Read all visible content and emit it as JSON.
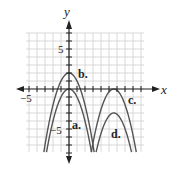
{
  "chart_data": {
    "type": "line",
    "title": "",
    "xlabel": "x",
    "ylabel": "y",
    "xlim": [
      -5.4,
      9.4
    ],
    "ylim": [
      -7.9,
      7.0
    ],
    "grid": true,
    "tick_labels": {
      "x": [
        "-5"
      ],
      "y": [
        "5",
        "-5"
      ]
    },
    "series": [
      {
        "name": "a.",
        "equation": "y = -x^2",
        "vertex": [
          0,
          0
        ]
      },
      {
        "name": "b.",
        "equation": "y = -x^2 + 2",
        "vertex": [
          0,
          2
        ]
      },
      {
        "name": "c.",
        "equation": "y = -(x - 6)^2",
        "vertex": [
          6,
          0
        ]
      },
      {
        "name": "d.",
        "equation": "y = -(x - 6)^2 - 3",
        "vertex": [
          6,
          -3
        ]
      }
    ]
  },
  "labels": {
    "x_axis": "x",
    "y_axis": "y",
    "x_tick_neg5": "−5",
    "y_tick_5": "5",
    "y_tick_neg5": "−5",
    "curve_a": "a.",
    "curve_b": "b.",
    "curve_c": "c.",
    "curve_d": "d."
  },
  "colors": {
    "grid": "#cfcfcf",
    "axis": "#222222",
    "curve": "#555555"
  }
}
